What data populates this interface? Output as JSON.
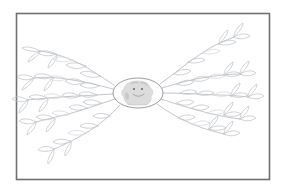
{
  "artwork": {
    "title": "Hand-drawn radial mind map sketch",
    "medium": "pencil sketch",
    "background_color": "#ffffff",
    "frame": {
      "name": "page-border",
      "color": "#6e7073",
      "stroke_width": 1.6,
      "x": 16,
      "y": 13,
      "width": 254,
      "height": 167
    },
    "center": {
      "name": "central-node",
      "shape": "oval",
      "cx": 138,
      "cy": 93,
      "rx": 25,
      "ry": 15,
      "outline_color": "#8f9299",
      "fill_color": "#fdfdfd",
      "figure": {
        "name": "smiling-blob-figure",
        "description": "small shaded smiling creature head",
        "body_color": "#dcdcdc",
        "shade_color": "#c6c6c6",
        "line_color": "#8c8c8c"
      }
    },
    "branch_style": {
      "stem_color": "#b9bcc2",
      "leaf_color": "#c3c6cc",
      "stroke_width": 0.85,
      "leaf_shape": "lens"
    },
    "left_branches": [
      {
        "name": "branch-left-1",
        "angle_label": "upper-left",
        "leaf_count": 7
      },
      {
        "name": "branch-left-2",
        "angle_label": "left-upper-mid",
        "leaf_count": 6
      },
      {
        "name": "branch-left-3",
        "angle_label": "left-mid",
        "leaf_count": 6
      },
      {
        "name": "branch-left-4",
        "angle_label": "left-lower-mid",
        "leaf_count": 6
      },
      {
        "name": "branch-left-5",
        "angle_label": "lower-left",
        "leaf_count": 7
      }
    ],
    "right_branches": [
      {
        "name": "branch-right-1",
        "angle_label": "upper-right",
        "leaf_count": 7
      },
      {
        "name": "branch-right-2",
        "angle_label": "right-upper-mid",
        "leaf_count": 6
      },
      {
        "name": "branch-right-3",
        "angle_label": "right-mid",
        "leaf_count": 6
      },
      {
        "name": "branch-right-4",
        "angle_label": "right-lower-mid",
        "leaf_count": 6
      },
      {
        "name": "branch-right-5",
        "angle_label": "lower-right",
        "leaf_count": 6
      }
    ],
    "labels": {
      "caption": ""
    }
  }
}
